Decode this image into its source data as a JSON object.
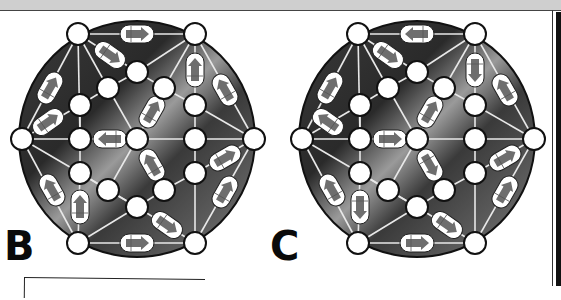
{
  "puzzles": [
    {
      "label": "B",
      "offset_x": 0,
      "arrows": [
        {
          "x": 137,
          "y": 34,
          "rot": 0
        },
        {
          "x": 110,
          "y": 55,
          "rot": 35
        },
        {
          "x": 50,
          "y": 88,
          "rot": -60
        },
        {
          "x": 48,
          "y": 122,
          "rot": -35
        },
        {
          "x": 195,
          "y": 70,
          "rot": -90
        },
        {
          "x": 225,
          "y": 90,
          "rot": -120
        },
        {
          "x": 152,
          "y": 112,
          "rot": -60
        },
        {
          "x": 110,
          "y": 139,
          "rot": 180
        },
        {
          "x": 152,
          "y": 165,
          "rot": -120
        },
        {
          "x": 225,
          "y": 158,
          "rot": -30
        },
        {
          "x": 225,
          "y": 192,
          "rot": -60
        },
        {
          "x": 52,
          "y": 190,
          "rot": -120
        },
        {
          "x": 80,
          "y": 207,
          "rot": -90
        },
        {
          "x": 167,
          "y": 225,
          "rot": 35
        },
        {
          "x": 137,
          "y": 243,
          "rot": 0
        }
      ]
    },
    {
      "label": "C",
      "offset_x": 280,
      "arrows": [
        {
          "x": 137,
          "y": 34,
          "rot": 180
        },
        {
          "x": 108,
          "y": 55,
          "rot": 35
        },
        {
          "x": 50,
          "y": 88,
          "rot": -60
        },
        {
          "x": 48,
          "y": 122,
          "rot": -145
        },
        {
          "x": 195,
          "y": 70,
          "rot": 90
        },
        {
          "x": 225,
          "y": 90,
          "rot": -120
        },
        {
          "x": 150,
          "y": 112,
          "rot": -60
        },
        {
          "x": 110,
          "y": 139,
          "rot": 0
        },
        {
          "x": 150,
          "y": 165,
          "rot": 60
        },
        {
          "x": 225,
          "y": 158,
          "rot": -30
        },
        {
          "x": 225,
          "y": 192,
          "rot": -60
        },
        {
          "x": 52,
          "y": 190,
          "rot": -120
        },
        {
          "x": 80,
          "y": 207,
          "rot": 90
        },
        {
          "x": 167,
          "y": 225,
          "rot": 35
        },
        {
          "x": 137,
          "y": 243,
          "rot": 0
        }
      ]
    }
  ],
  "nodes": [
    [
      78,
      34
    ],
    [
      195,
      34
    ],
    [
      137,
      72
    ],
    [
      108,
      88
    ],
    [
      164,
      88
    ],
    [
      80,
      105
    ],
    [
      195,
      105
    ],
    [
      22,
      139
    ],
    [
      80,
      139
    ],
    [
      137,
      139
    ],
    [
      195,
      139
    ],
    [
      254,
      139
    ],
    [
      80,
      173
    ],
    [
      195,
      173
    ],
    [
      108,
      190
    ],
    [
      164,
      190
    ],
    [
      137,
      207
    ],
    [
      78,
      243
    ],
    [
      195,
      243
    ]
  ],
  "edges": [
    [
      0,
      1
    ],
    [
      0,
      2
    ],
    [
      0,
      8
    ],
    [
      0,
      7
    ],
    [
      0,
      3
    ],
    [
      1,
      2
    ],
    [
      1,
      6
    ],
    [
      1,
      11
    ],
    [
      1,
      4
    ],
    [
      2,
      3
    ],
    [
      2,
      4
    ],
    [
      3,
      5
    ],
    [
      3,
      9
    ],
    [
      4,
      6
    ],
    [
      5,
      7
    ],
    [
      5,
      8
    ],
    [
      6,
      10
    ],
    [
      6,
      11
    ],
    [
      7,
      8
    ],
    [
      8,
      9
    ],
    [
      9,
      10
    ],
    [
      10,
      11
    ],
    [
      7,
      12
    ],
    [
      7,
      17
    ],
    [
      8,
      12
    ],
    [
      9,
      14
    ],
    [
      9,
      15
    ],
    [
      10,
      13
    ],
    [
      11,
      13
    ],
    [
      11,
      18
    ],
    [
      12,
      14
    ],
    [
      12,
      17
    ],
    [
      13,
      15
    ],
    [
      14,
      16
    ],
    [
      15,
      16
    ],
    [
      16,
      17
    ],
    [
      16,
      18
    ],
    [
      13,
      18
    ],
    [
      17,
      18
    ],
    [
      4,
      9
    ],
    [
      12,
      16
    ]
  ],
  "colors": {
    "disc_dark": "#2a2a2a",
    "disc_light": "#9a9a9a",
    "node_fill": "#ffffff",
    "arrow_fill": "#6e6e6e",
    "line": "#e8e8e8"
  }
}
